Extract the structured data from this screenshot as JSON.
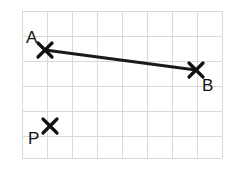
{
  "figure": {
    "width": 240,
    "height": 169,
    "background_color": "#ffffff"
  },
  "grid": {
    "line_color": "#d9d9d9",
    "cell_size": 25,
    "origin_x": 22,
    "origin_y": 11,
    "vertical_x": [
      22,
      47,
      72,
      97,
      122,
      147,
      172,
      197,
      222
    ],
    "horizontal_y": [
      11,
      36,
      61,
      86,
      111,
      136,
      158
    ],
    "x_start": 22,
    "x_end": 222,
    "y_start": 11,
    "y_end": 158
  },
  "points": [
    {
      "id": "A",
      "label": "A",
      "marker": "x-marker",
      "x": 45,
      "y": 50,
      "label_x": 26,
      "label_y": 43,
      "label_position": "upper-left"
    },
    {
      "id": "B",
      "label": "B",
      "marker": "x-marker",
      "x": 196,
      "y": 70,
      "label_x": 202,
      "label_y": 91,
      "label_position": "lower-right"
    },
    {
      "id": "P",
      "label": "P",
      "marker": "x-marker",
      "x": 50,
      "y": 126,
      "label_x": 28,
      "label_y": 144,
      "label_position": "lower-left"
    }
  ],
  "segments": [
    {
      "id": "AB",
      "from": "A",
      "to": "B",
      "x1": 45,
      "y1": 50,
      "x2": 196,
      "y2": 70,
      "color": "#1a1a1a",
      "thickness": 3
    }
  ],
  "marker_style": {
    "arm_length": 7,
    "color": "#111111",
    "thickness": 3.2
  }
}
